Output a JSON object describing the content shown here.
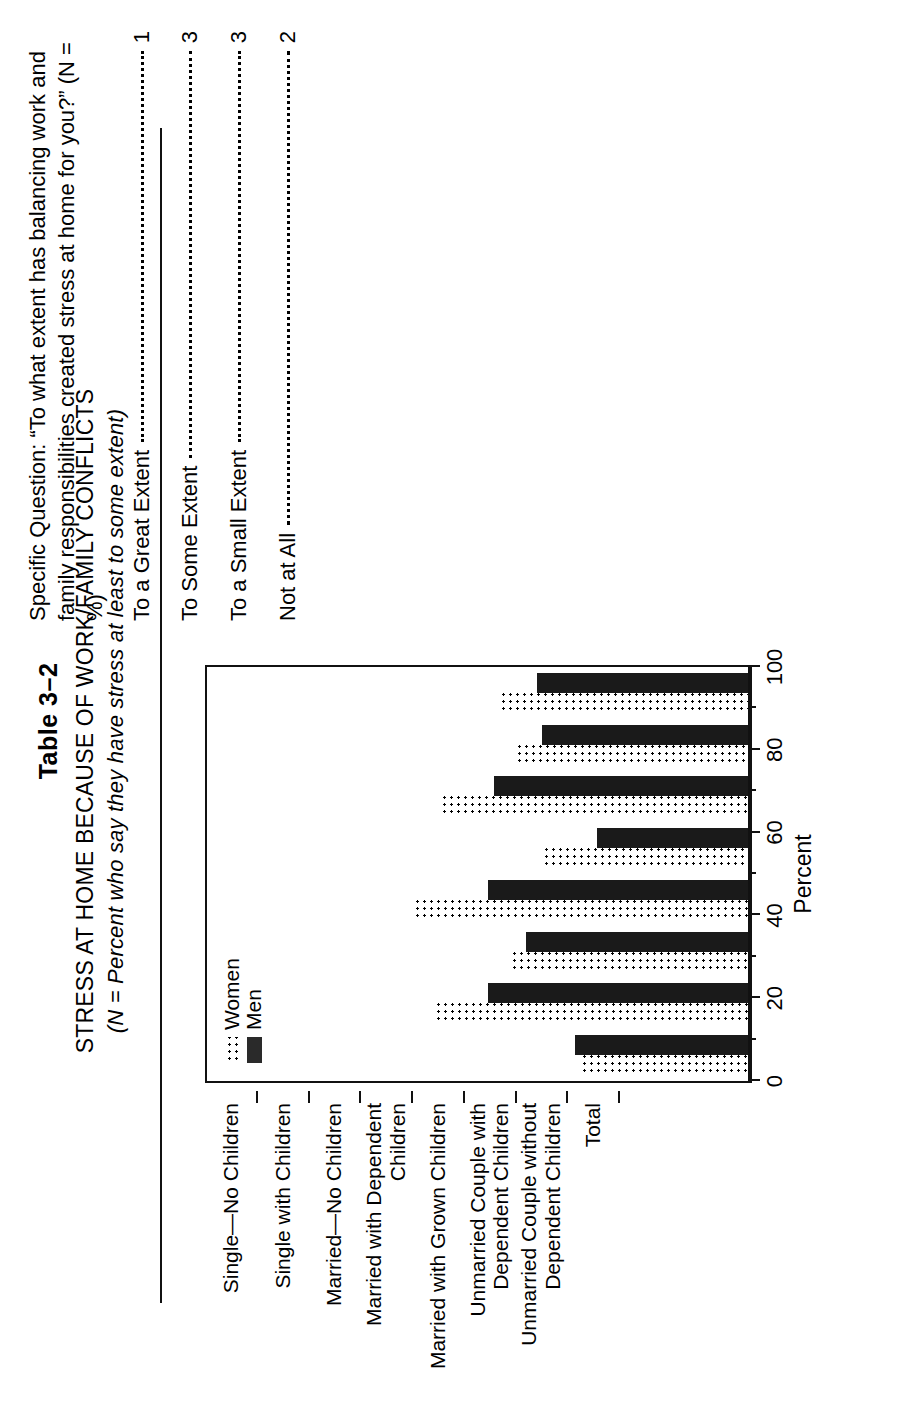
{
  "header": {
    "table_number": "Table 3–2",
    "title": "STRESS AT HOME BECAUSE OF WORK/FAMILY CONFLICTS",
    "subtitle": "(N = Percent who say they have stress at least to some extent)"
  },
  "legend": {
    "women": "Women",
    "men": "Men"
  },
  "note": {
    "question": "Specific Question: “To what extent has balancing work and family responsibilities created stress at home for you?” (N = %)",
    "options": [
      {
        "label": "To a Great Extent",
        "value": "1"
      },
      {
        "label": "To Some Extent",
        "value": "3"
      },
      {
        "label": "To a Small Extent",
        "value": "3"
      },
      {
        "label": "Not at All",
        "value": "2"
      }
    ]
  },
  "chart_data": {
    "type": "bar",
    "title": "STRESS AT HOME BECAUSE OF WORK/FAMILY CONFLICTS",
    "xlabel": "",
    "ylabel": "Percent",
    "ylim": [
      0,
      100
    ],
    "yticks": [
      0,
      20,
      40,
      60,
      80,
      100
    ],
    "grid": false,
    "legend_position": "top-left",
    "orientation": "vertical",
    "categories": [
      "Single—No Children",
      "Single with Children",
      "Married—No Children",
      "Married with Dependent\nChildren",
      "Married with Grown Children",
      "Unmarried Couple with\nDependent Children",
      "Unmarried Couple without\nDependent Children",
      "Total"
    ],
    "series": [
      {
        "name": "Women",
        "values": [
          31,
          58,
          44,
          62,
          38,
          57,
          43,
          46
        ]
      },
      {
        "name": "Men",
        "values": [
          32,
          48,
          41,
          48,
          28,
          47,
          38,
          39
        ]
      }
    ]
  }
}
